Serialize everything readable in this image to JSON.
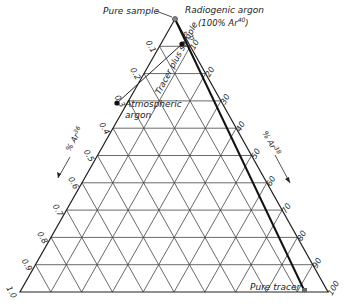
{
  "diagram": {
    "type": "ternary",
    "vertices": {
      "top": {
        "label": "Radiogenic argon",
        "sublabel": "(100% Ar",
        "sup": "40",
        "close": ")"
      },
      "bottom_left": {
        "label": ""
      },
      "bottom_right": {
        "label": "Pure tracer"
      }
    },
    "points": {
      "pure_sample": "Pure sample",
      "tracer_plus_sample": "Tracer plus sample",
      "atmospheric": [
        "Atmospheric",
        "argon"
      ],
      "pure_tracer": "Pure tracer"
    },
    "left_axis": {
      "title": "% Ar",
      "title_sub": "36",
      "ticks": [
        "0.1",
        "0.2",
        "0.3",
        "0.4",
        "0.5",
        "0.6",
        "0.7",
        "0.8",
        "0.9",
        "1.0"
      ]
    },
    "right_axis": {
      "title": "% Ar",
      "title_sub": "38",
      "ticks": [
        "10",
        "20",
        "30",
        "40",
        "50",
        "60",
        "70",
        "80",
        "90",
        "100"
      ]
    },
    "inner_labels": {
      "top_5": "5",
      "top_p": "p"
    },
    "colors": {
      "line": "#333333",
      "thick_line": "#111111",
      "text": "#222222"
    }
  }
}
